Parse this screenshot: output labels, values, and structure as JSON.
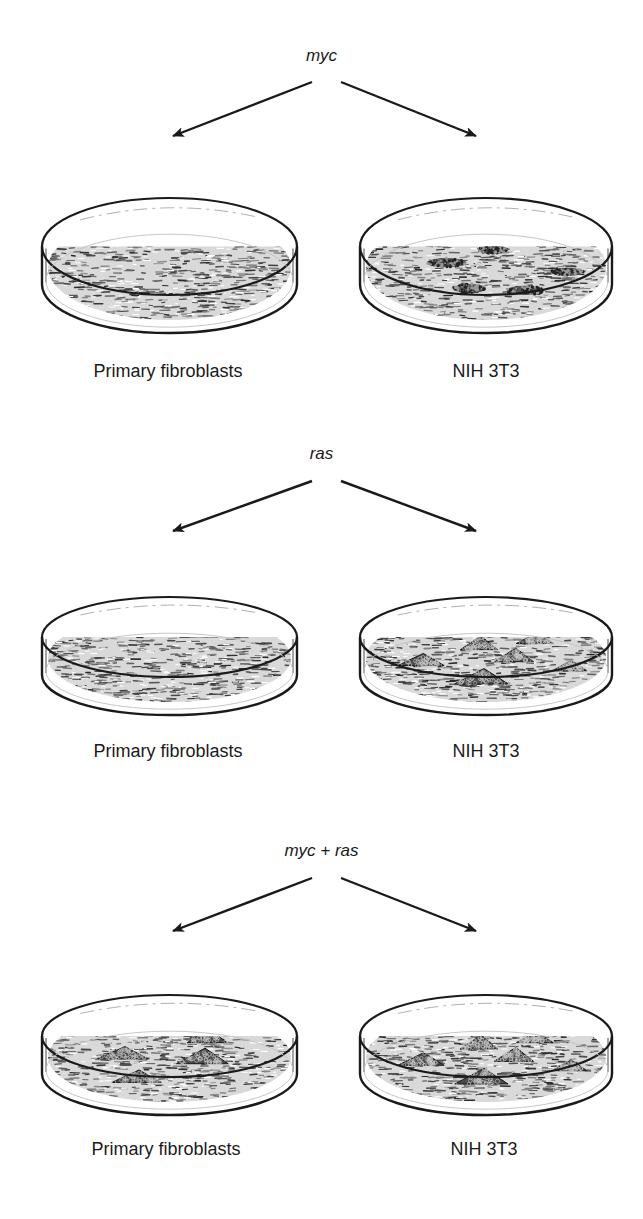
{
  "figure": {
    "panels": [
      {
        "gene": "myc",
        "left": {
          "label": "Primary fibroblasts",
          "colonies": []
        },
        "right": {
          "label": "NIH 3T3",
          "colonies": [
            {
              "cx": 0.33,
              "cy": 0.36,
              "w": 0.17,
              "h": 0.1,
              "style": "dense"
            },
            {
              "cx": 0.53,
              "cy": 0.22,
              "w": 0.13,
              "h": 0.09,
              "style": "dense"
            },
            {
              "cx": 0.85,
              "cy": 0.46,
              "w": 0.14,
              "h": 0.09,
              "style": "dense"
            },
            {
              "cx": 0.43,
              "cy": 0.64,
              "w": 0.14,
              "h": 0.1,
              "style": "dense"
            },
            {
              "cx": 0.67,
              "cy": 0.66,
              "w": 0.16,
              "h": 0.1,
              "style": "dense"
            }
          ]
        }
      },
      {
        "gene": "ras",
        "left": {
          "label": "Primary fibroblasts",
          "colonies": []
        },
        "right": {
          "label": "NIH 3T3",
          "colonies": [
            {
              "cx": 0.22,
              "cy": 0.48,
              "w": 0.2,
              "h": 0.16,
              "style": "mesh"
            },
            {
              "cx": 0.47,
              "cy": 0.26,
              "w": 0.16,
              "h": 0.18,
              "style": "mesh"
            },
            {
              "cx": 0.71,
              "cy": 0.2,
              "w": 0.16,
              "h": 0.14,
              "style": "mesh"
            },
            {
              "cx": 0.62,
              "cy": 0.42,
              "w": 0.17,
              "h": 0.18,
              "style": "mesh"
            },
            {
              "cx": 0.86,
              "cy": 0.56,
              "w": 0.15,
              "h": 0.14,
              "style": "mesh"
            },
            {
              "cx": 0.48,
              "cy": 0.7,
              "w": 0.23,
              "h": 0.2,
              "style": "mesh"
            }
          ]
        }
      },
      {
        "gene": "myc + ras",
        "left": {
          "label": "Primary fibroblasts",
          "colonies": [
            {
              "cx": 0.3,
              "cy": 0.4,
              "w": 0.22,
              "h": 0.16,
              "style": "mesh"
            },
            {
              "cx": 0.66,
              "cy": 0.18,
              "w": 0.17,
              "h": 0.18,
              "style": "mesh"
            },
            {
              "cx": 0.64,
              "cy": 0.44,
              "w": 0.22,
              "h": 0.2,
              "style": "mesh"
            },
            {
              "cx": 0.36,
              "cy": 0.7,
              "w": 0.21,
              "h": 0.16,
              "style": "mesh"
            }
          ]
        },
        "right": {
          "label": "NIH 3T3",
          "colonies": [
            {
              "cx": 0.22,
              "cy": 0.48,
              "w": 0.2,
              "h": 0.16,
              "style": "mesh"
            },
            {
              "cx": 0.47,
              "cy": 0.26,
              "w": 0.16,
              "h": 0.18,
              "style": "mesh"
            },
            {
              "cx": 0.71,
              "cy": 0.2,
              "w": 0.16,
              "h": 0.14,
              "style": "mesh"
            },
            {
              "cx": 0.62,
              "cy": 0.42,
              "w": 0.17,
              "h": 0.18,
              "style": "mesh"
            },
            {
              "cx": 0.86,
              "cy": 0.56,
              "w": 0.15,
              "h": 0.14,
              "style": "mesh"
            },
            {
              "cx": 0.48,
              "cy": 0.7,
              "w": 0.23,
              "h": 0.2,
              "style": "mesh"
            }
          ]
        }
      }
    ],
    "colors": {
      "ink": "#1a1a1a",
      "background": "#ffffff",
      "lawn": "#8a8a8a",
      "colony": "#2a2a2a"
    }
  }
}
